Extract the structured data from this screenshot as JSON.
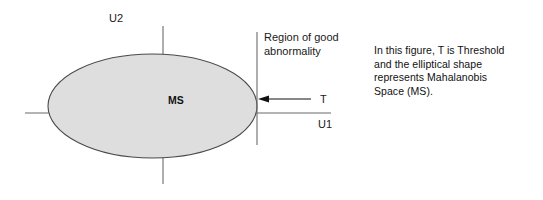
{
  "figure": {
    "axes": {
      "y_axis_label": "U2",
      "x_axis_label": "U1"
    },
    "ellipse": {
      "label": "MS",
      "fill_color": "#dedede",
      "stroke_color": "#4a4a4a"
    },
    "threshold": {
      "line_label": "T",
      "region_label_line1": "Region of good",
      "region_label_line2": "abnormality",
      "arrow_direction": "left"
    },
    "caption": {
      "line1": "In this figure, T is Threshold",
      "line2": "and the elliptical shape",
      "line3": "represents Mahalanobis",
      "line4": "Space (MS)."
    },
    "colors": {
      "axis": "#6b6b6b",
      "text": "#111111",
      "background": "#ffffff"
    }
  }
}
